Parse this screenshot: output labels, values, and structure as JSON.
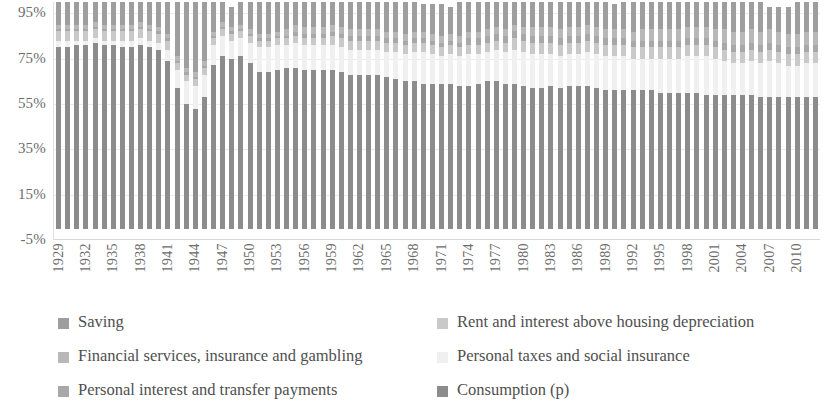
{
  "chart_data": {
    "type": "bar",
    "stacked": true,
    "title": "",
    "subtitle": "",
    "xlabel": "",
    "ylabel": "",
    "ylim": [
      -5,
      100
    ],
    "grid": true,
    "legend_position": "bottom",
    "y_ticks": [
      "95%",
      "75%",
      "55%",
      "35%",
      "15%",
      "-5%"
    ],
    "y_tick_values": [
      95,
      75,
      55,
      35,
      15,
      -5
    ],
    "x_tick_labels": [
      "1929",
      "1932",
      "1935",
      "1938",
      "1941",
      "1944",
      "1947",
      "1950",
      "1953",
      "1956",
      "1959",
      "1962",
      "1965",
      "1968",
      "1971",
      "1974",
      "1977",
      "1980",
      "1983",
      "1986",
      "1989",
      "1992",
      "1995",
      "1998",
      "2001",
      "2004",
      "2007",
      "2010"
    ],
    "x_tick_step": 3,
    "categories": [
      1929,
      1930,
      1931,
      1932,
      1933,
      1934,
      1935,
      1936,
      1937,
      1938,
      1939,
      1940,
      1941,
      1942,
      1943,
      1944,
      1945,
      1946,
      1947,
      1948,
      1949,
      1950,
      1951,
      1952,
      1953,
      1954,
      1955,
      1956,
      1957,
      1958,
      1959,
      1960,
      1961,
      1962,
      1963,
      1964,
      1965,
      1966,
      1967,
      1968,
      1969,
      1970,
      1971,
      1972,
      1973,
      1974,
      1975,
      1976,
      1977,
      1978,
      1979,
      1980,
      1981,
      1982,
      1983,
      1984,
      1985,
      1986,
      1987,
      1988,
      1989,
      1990,
      1991,
      1992,
      1993,
      1994,
      1995,
      1996,
      1997,
      1998,
      1999,
      2000,
      2001,
      2002,
      2003,
      2004,
      2005,
      2006,
      2007,
      2008,
      2009,
      2010,
      2011,
      2012
    ],
    "series": [
      {
        "name": "Consumption (p)",
        "color": "#8c8c8c",
        "values": [
          80,
          80,
          81,
          81,
          82,
          81,
          81,
          80,
          80,
          81,
          80,
          79,
          74,
          62,
          55,
          53,
          58,
          72,
          76,
          75,
          76,
          73,
          69,
          69,
          70,
          71,
          71,
          70,
          70,
          70,
          70,
          69,
          68,
          68,
          68,
          68,
          67,
          66,
          65,
          65,
          64,
          64,
          64,
          64,
          63,
          63,
          64,
          65,
          65,
          64,
          64,
          63,
          62,
          62,
          63,
          62,
          63,
          63,
          63,
          62,
          61,
          61,
          61,
          61,
          61,
          61,
          60,
          60,
          60,
          60,
          60,
          59,
          59,
          59,
          59,
          59,
          59,
          58,
          58,
          58,
          58,
          58,
          58,
          58
        ]
      },
      {
        "name": "Personal taxes and social insurance",
        "color": "#f0f0f0",
        "values": [
          3,
          3,
          2,
          2,
          2,
          2,
          2,
          3,
          3,
          3,
          3,
          3,
          5,
          8,
          10,
          10,
          10,
          9,
          9,
          8,
          8,
          9,
          11,
          11,
          11,
          10,
          11,
          11,
          11,
          11,
          11,
          11,
          11,
          11,
          11,
          11,
          11,
          12,
          12,
          13,
          14,
          13,
          12,
          13,
          13,
          14,
          13,
          13,
          14,
          14,
          15,
          15,
          15,
          15,
          14,
          14,
          14,
          14,
          15,
          15,
          15,
          15,
          15,
          14,
          14,
          14,
          15,
          15,
          15,
          16,
          16,
          17,
          16,
          15,
          14,
          14,
          15,
          15,
          16,
          15,
          14,
          14,
          15,
          15
        ]
      },
      {
        "name": "Rent and interest above housing depreciation",
        "color": "#c9c9c9",
        "values": [
          4,
          4,
          4,
          4,
          4,
          4,
          4,
          4,
          4,
          4,
          4,
          4,
          4,
          3,
          3,
          3,
          3,
          3,
          3,
          3,
          3,
          3,
          3,
          3,
          3,
          3,
          3,
          3,
          3,
          3,
          4,
          4,
          4,
          4,
          4,
          4,
          4,
          4,
          4,
          4,
          4,
          4,
          4,
          4,
          4,
          4,
          4,
          4,
          4,
          4,
          5,
          5,
          5,
          5,
          5,
          5,
          5,
          5,
          5,
          5,
          5,
          5,
          5,
          5,
          5,
          5,
          5,
          5,
          5,
          5,
          5,
          5,
          5,
          5,
          5,
          5,
          5,
          5,
          5,
          5,
          5,
          5,
          5,
          5
        ]
      },
      {
        "name": "Personal interest and transfer payments",
        "color": "#a8a8a8",
        "values": [
          1,
          1,
          1,
          1,
          1,
          1,
          1,
          1,
          1,
          1,
          1,
          1,
          1,
          1,
          1,
          1,
          1,
          1,
          1,
          1,
          1,
          1,
          1,
          1,
          1,
          1,
          2,
          2,
          2,
          2,
          2,
          2,
          2,
          2,
          2,
          2,
          2,
          2,
          2,
          2,
          2,
          2,
          2,
          2,
          2,
          3,
          3,
          3,
          3,
          3,
          3,
          3,
          3,
          3,
          3,
          3,
          3,
          3,
          3,
          3,
          3,
          3,
          3,
          3,
          3,
          3,
          3,
          3,
          3,
          3,
          3,
          3,
          3,
          3,
          3,
          3,
          3,
          3,
          3,
          3,
          3,
          3,
          3,
          3
        ]
      },
      {
        "name": "Financial services, insurance and gambling",
        "color": "#b8b8b8",
        "values": [
          2,
          2,
          2,
          2,
          2,
          2,
          2,
          2,
          2,
          2,
          2,
          2,
          2,
          2,
          2,
          2,
          2,
          2,
          2,
          2,
          2,
          2,
          2,
          2,
          2,
          3,
          3,
          3,
          3,
          3,
          3,
          3,
          3,
          3,
          3,
          3,
          3,
          3,
          3,
          3,
          3,
          3,
          3,
          3,
          3,
          3,
          3,
          3,
          3,
          3,
          3,
          3,
          4,
          4,
          4,
          4,
          4,
          4,
          4,
          4,
          4,
          4,
          4,
          4,
          5,
          5,
          5,
          5,
          5,
          5,
          5,
          5,
          5,
          6,
          6,
          6,
          6,
          6,
          6,
          6,
          6,
          6,
          6,
          6
        ]
      },
      {
        "name": "Saving",
        "color": "#9e9e9e",
        "values": [
          10,
          10,
          10,
          10,
          9,
          10,
          10,
          10,
          10,
          9,
          10,
          11,
          14,
          24,
          29,
          31,
          26,
          13,
          9,
          9,
          10,
          12,
          14,
          14,
          13,
          13,
          10,
          11,
          11,
          11,
          10,
          11,
          12,
          12,
          12,
          12,
          13,
          13,
          14,
          13,
          12,
          13,
          14,
          12,
          15,
          13,
          13,
          12,
          11,
          12,
          10,
          11,
          11,
          11,
          11,
          13,
          11,
          11,
          10,
          11,
          12,
          11,
          12,
          14,
          12,
          12,
          12,
          12,
          12,
          11,
          11,
          11,
          12,
          12,
          13,
          13,
          12,
          13,
          10,
          11,
          12,
          14,
          13,
          13
        ]
      }
    ],
    "colors": {
      "saving": "#9e9e9e",
      "financial_services": "#b8b8b8",
      "personal_interest": "#a8a8a8",
      "rent_interest": "#c9c9c9",
      "personal_taxes": "#f0f0f0",
      "consumption": "#8c8c8c",
      "gridline": "#ececec",
      "axis": "#d8d8d8",
      "text": "#6b6b6b"
    }
  },
  "legend": {
    "left_column": [
      {
        "label": "Saving",
        "color_key": "saving",
        "icon": "legend-swatch-icon"
      },
      {
        "label": "Financial services, insurance and gambling",
        "color_key": "financial_services",
        "icon": "legend-swatch-icon"
      },
      {
        "label": "Personal interest and transfer payments",
        "color_key": "personal_interest",
        "icon": "legend-swatch-icon"
      }
    ],
    "right_column": [
      {
        "label": "Rent and interest above housing depreciation",
        "color_key": "rent_interest",
        "icon": "legend-swatch-icon"
      },
      {
        "label": "Personal taxes and social insurance",
        "color_key": "personal_taxes",
        "icon": "legend-swatch-icon"
      },
      {
        "label": "Consumption (p)",
        "color_key": "consumption",
        "icon": "legend-swatch-icon"
      }
    ]
  }
}
